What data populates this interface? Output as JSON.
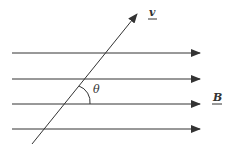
{
  "diagram": {
    "field_lines_count": 4,
    "velocity_label": "v",
    "field_label": "B",
    "angle_label": "θ",
    "line_color": "#333333"
  }
}
